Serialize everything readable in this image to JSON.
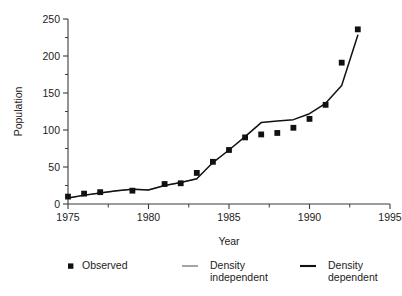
{
  "chart_data": {
    "type": "scatter",
    "title": "",
    "xlabel": "Year",
    "ylabel": "Population",
    "xlim": [
      1975,
      1995
    ],
    "ylim": [
      0,
      250
    ],
    "grid": false,
    "legend_position": "below",
    "x_ticks": [
      1975,
      1980,
      1985,
      1990,
      1995
    ],
    "x_tick_labels": [
      "1975",
      "1980",
      "1985",
      "1990",
      "1995"
    ],
    "x_minor_ticks": [
      1977.5,
      1982.5,
      1987.5,
      1992.5
    ],
    "y_ticks": [
      0,
      50,
      100,
      150,
      200,
      250
    ],
    "y_tick_labels": [
      "0",
      "50",
      "100",
      "150",
      "200",
      "250"
    ],
    "y_minor_ticks": [
      25,
      75,
      125,
      175,
      225
    ],
    "series": [
      {
        "name": "Observed",
        "kind": "markers",
        "marker": "square",
        "color": "#111111",
        "x": [
          1975,
          1976,
          1977,
          1979,
          1981,
          1982,
          1983,
          1984,
          1985,
          1986,
          1987,
          1988,
          1989,
          1990,
          1991,
          1992,
          1993
        ],
        "values": [
          10,
          14,
          16,
          18,
          27,
          28,
          42,
          57,
          73,
          90,
          94,
          96,
          103,
          115,
          134,
          191,
          236
        ]
      },
      {
        "name": "Density independent",
        "kind": "line",
        "color": "#8d8d8d",
        "x": [
          1975,
          1977,
          1979,
          1980,
          1981,
          1982,
          1983
        ],
        "values": [
          8,
          15,
          20,
          19,
          25,
          29,
          34
        ]
      },
      {
        "name": "Density dependent",
        "kind": "line",
        "color": "#111111",
        "x": [
          1975,
          1976,
          1977,
          1978,
          1979,
          1980,
          1981,
          1982,
          1983,
          1984,
          1985,
          1986,
          1987,
          1988,
          1989,
          1990,
          1991,
          1992,
          1993
        ],
        "values": [
          8,
          12,
          15,
          18,
          20,
          19,
          25,
          29,
          34,
          56,
          73,
          91,
          110,
          112,
          114,
          122,
          136,
          160,
          228
        ]
      }
    ]
  },
  "axes": {
    "y_title": "Population",
    "x_title": "Year"
  },
  "legend": {
    "items": [
      {
        "label": "Observed",
        "symbol": "square-marker",
        "color": "#111111"
      },
      {
        "label_line1": "Density",
        "label_line2": "independent",
        "symbol": "line-swatch",
        "color": "#8d8d8d"
      },
      {
        "label_line1": "Density",
        "label_line2": "dependent",
        "symbol": "line-swatch",
        "color": "#111111"
      }
    ]
  }
}
